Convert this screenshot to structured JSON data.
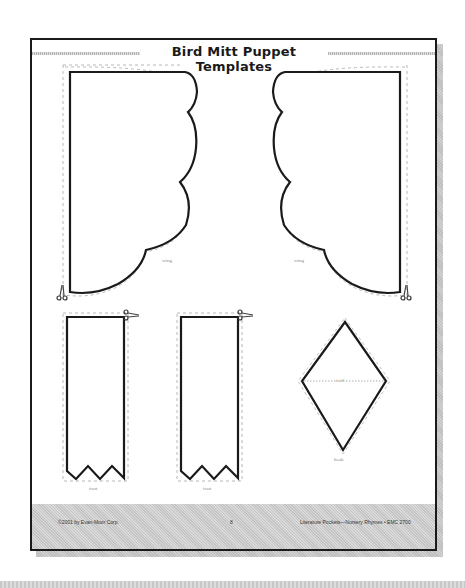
{
  "page": {
    "title": "Bird Mitt Puppet Templates",
    "footer": {
      "copyright": "©2001 by Evan-Moor Corp.",
      "page_number": "8",
      "series": "Literature Pockets—Nursery Rhymes • EMC 2700"
    }
  },
  "templates": [
    {
      "name": "wing-left",
      "label": "wing"
    },
    {
      "name": "wing-right",
      "label": "wing"
    },
    {
      "name": "foot-left",
      "label": "foot"
    },
    {
      "name": "foot-right",
      "label": "foot"
    },
    {
      "name": "beak",
      "label": "beak",
      "fold_label": "fold"
    }
  ],
  "icons": {
    "scissors": "scissors-icon"
  },
  "colors": {
    "outline": "#1a1a1a",
    "cut_line": "#b0b0b0",
    "footer_band": "#cfcfcf",
    "shadow": "#c8c8c8"
  }
}
